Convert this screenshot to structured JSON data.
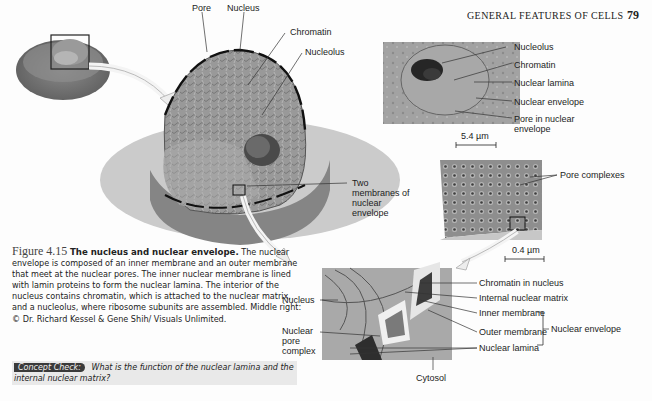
{
  "page": {
    "running_header": "GENERAL FEATURES OF CELLS",
    "page_number": "79"
  },
  "figure": {
    "number": "Figure 4.15",
    "title": "The nucleus and nuclear envelope.",
    "caption": "The nuclear envelope is composed of an inner membrane and an outer membrane that meet at the nuclear pores. The inner nuclear membrane is lined with lamin proteins to form the nuclear lamina. The interior of the nucleus contains chromatin, which is attached to the nuclear matrix, and a nucleolus, where ribosome subunits are assembled. Middle right: © Dr. Richard Kessel & Gene Shih/ Visuals Unlimited.",
    "concept_check_label": "Concept Check:",
    "concept_check_question": "What is the function of the nuclear lamina and the internal nuclear matrix?"
  },
  "main_illustration": {
    "labels": {
      "pore": "Pore",
      "nucleus": "Nucleus",
      "chromatin": "Chromatin",
      "nucleolus": "Nucleolus",
      "two_membranes": "Two membranes of nuclear envelope"
    }
  },
  "micrograph_top": {
    "labels": {
      "nucleolus": "Nucleolus",
      "chromatin": "Chromatin",
      "nuclear_lamina": "Nuclear lamina",
      "nuclear_envelope": "Nuclear envelope",
      "pore": "Pore in nuclear envelope"
    },
    "scale_bar": "5.4 µm"
  },
  "micrograph_middle": {
    "labels": {
      "pore_complexes": "Pore complexes"
    },
    "scale_bar": "0.4 µm"
  },
  "detail_illustration": {
    "labels": {
      "nucleus": "Nucleus",
      "nuclear_pore_complex": "Nuclear pore complex",
      "chromatin_in_nucleus": "Chromatin in nucleus",
      "internal_nuclear_matrix": "Internal nuclear matrix",
      "inner_membrane": "Inner membrane",
      "outer_membrane": "Outer membrane",
      "nuclear_envelope": "Nuclear envelope",
      "nuclear_lamina": "Nuclear lamina",
      "cytosol": "Cytosol"
    }
  }
}
